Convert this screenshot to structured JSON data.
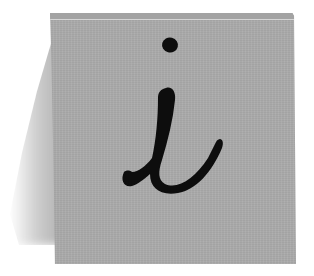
{
  "image": {
    "subject": "sticky note with handwritten info letter",
    "glyph": "i",
    "icon": "info-icon",
    "colors": {
      "background": "#ffffff",
      "note": "#ababab",
      "note_top_highlight": "#d6d6d6",
      "ink": "#0d0d0d"
    }
  }
}
